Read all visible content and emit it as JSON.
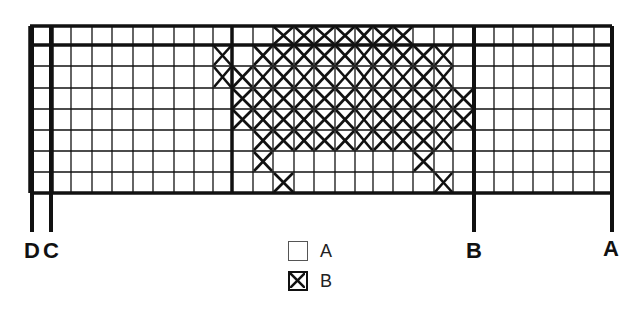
{
  "diagram": {
    "type": "knitting-chart",
    "grid": {
      "columns": 29,
      "rows": 8,
      "col_lines_x": [
        30,
        52,
        71,
        92,
        112,
        133,
        153,
        174,
        194,
        213,
        232,
        253,
        273,
        294,
        314,
        335,
        355,
        373,
        393,
        413,
        434,
        453,
        474,
        494,
        513,
        533,
        553,
        573,
        594,
        612
      ],
      "row_lines_y": [
        26,
        45,
        66,
        88,
        109,
        130,
        151,
        172,
        193
      ],
      "thick_cols": [
        0,
        1,
        10,
        22,
        29
      ],
      "thick_rows": [
        0,
        1,
        8
      ],
      "crossed_cells": [
        {
          "row": 0,
          "from": 12,
          "to": 18
        },
        {
          "row": 1,
          "cells": [
            9,
            11,
            12,
            13,
            14,
            15,
            16,
            17,
            18,
            19,
            20
          ]
        },
        {
          "row": 2,
          "from": 9,
          "to": 20
        },
        {
          "row": 3,
          "from": 10,
          "to": 21
        },
        {
          "row": 4,
          "from": 10,
          "to": 21
        },
        {
          "row": 5,
          "from": 11,
          "to": 20
        },
        {
          "row": 6,
          "cells": [
            11,
            19
          ]
        },
        {
          "row": 7,
          "cells": [
            12,
            20
          ]
        }
      ]
    },
    "markers": [
      {
        "label": "D",
        "x": 32
      },
      {
        "label": "C",
        "x": 51
      },
      {
        "label": "B",
        "x": 474
      },
      {
        "label": "A",
        "x": 612
      }
    ],
    "legend": [
      {
        "symbol": "empty-square",
        "label": "A"
      },
      {
        "symbol": "crossed-square",
        "label": "B"
      }
    ]
  }
}
